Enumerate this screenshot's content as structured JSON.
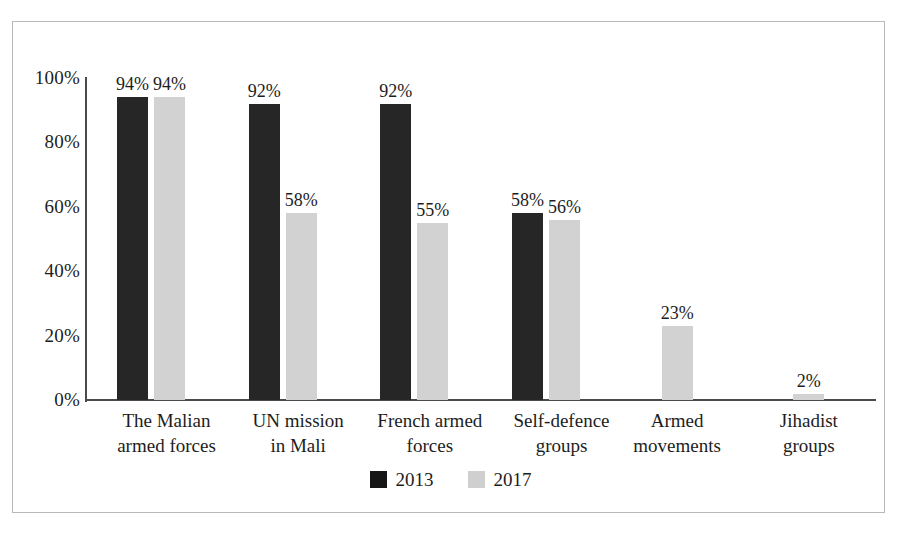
{
  "chart_data": {
    "type": "bar",
    "title": "",
    "subtitle": "",
    "xlabel": "",
    "ylabel": "",
    "ylim": [
      0,
      100
    ],
    "yticks": [
      "0%",
      "20%",
      "40%",
      "60%",
      "80%",
      "100%"
    ],
    "ytick_values": [
      0,
      20,
      40,
      60,
      80,
      100
    ],
    "grid": false,
    "legend_position": "bottom-center",
    "categories": [
      "The Malian\narmed forces",
      "UN mission\nin Mali",
      "French armed\nforces",
      "Self-defence\ngroups",
      "Armed\nmovements",
      "Jihadist\ngroups"
    ],
    "series": [
      {
        "name": "2013",
        "color": "#262626",
        "values": [
          94,
          92,
          92,
          58,
          null,
          null
        ],
        "labels": [
          "94%",
          "92%",
          "92%",
          "58%",
          "",
          ""
        ]
      },
      {
        "name": "2017",
        "color": "#d2d2d2",
        "values": [
          94,
          58,
          55,
          56,
          23,
          2
        ],
        "labels": [
          "94%",
          "58%",
          "55%",
          "56%",
          "23%",
          "2%"
        ]
      }
    ]
  },
  "legend": {
    "items": [
      {
        "label": "2013",
        "color": "#161616"
      },
      {
        "label": "2017",
        "color": "#cfcfcf"
      }
    ]
  }
}
